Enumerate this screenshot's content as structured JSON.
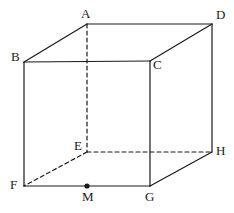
{
  "figure": {
    "name": "cube-abcd-efgh",
    "background_color": "#ffffff",
    "line_color": "#1a1a1a",
    "solid_stroke_width": 1.2,
    "dashed_stroke_width": 1.2,
    "dash_pattern": "4 3",
    "point_radius": 2.6
  },
  "vertices": [
    {
      "id": "A",
      "label": "A",
      "x": 87,
      "y": 24,
      "label_x": 81,
      "label_y": 7,
      "hidden": false
    },
    {
      "id": "B",
      "label": "B",
      "x": 24,
      "y": 62,
      "label_x": 11,
      "label_y": 50,
      "hidden": false
    },
    {
      "id": "C",
      "label": "C",
      "x": 150,
      "y": 61,
      "label_x": 153,
      "label_y": 58,
      "hidden": false
    },
    {
      "id": "D",
      "label": "D",
      "x": 212,
      "y": 24,
      "label_x": 216,
      "label_y": 8,
      "hidden": false
    },
    {
      "id": "E",
      "label": "E",
      "x": 87,
      "y": 152,
      "label_x": 74,
      "label_y": 139,
      "hidden": true
    },
    {
      "id": "F",
      "label": "F",
      "x": 24,
      "y": 186,
      "label_x": 10,
      "label_y": 178,
      "hidden": false
    },
    {
      "id": "G",
      "label": "G",
      "x": 150,
      "y": 186,
      "label_x": 145,
      "label_y": 190,
      "hidden": false
    },
    {
      "id": "H",
      "label": "H",
      "x": 212,
      "y": 152,
      "label_x": 216,
      "label_y": 144,
      "hidden": false
    }
  ],
  "points": [
    {
      "id": "M",
      "label": "M",
      "x": 87,
      "y": 186,
      "label_x": 82,
      "label_y": 190,
      "marked": true
    }
  ],
  "edges": [
    {
      "id": "AB",
      "from": "A",
      "to": "B",
      "style": "solid"
    },
    {
      "id": "AD",
      "from": "A",
      "to": "D",
      "style": "solid"
    },
    {
      "id": "BC",
      "from": "B",
      "to": "C",
      "style": "solid"
    },
    {
      "id": "CD",
      "from": "C",
      "to": "D",
      "style": "solid"
    },
    {
      "id": "BF",
      "from": "B",
      "to": "F",
      "style": "solid"
    },
    {
      "id": "CG",
      "from": "C",
      "to": "G",
      "style": "solid"
    },
    {
      "id": "DH",
      "from": "D",
      "to": "H",
      "style": "solid"
    },
    {
      "id": "FG",
      "from": "F",
      "to": "G",
      "style": "solid"
    },
    {
      "id": "GH",
      "from": "G",
      "to": "H",
      "style": "solid"
    },
    {
      "id": "AE",
      "from": "A",
      "to": "E",
      "style": "dashed"
    },
    {
      "id": "EF",
      "from": "E",
      "to": "F",
      "style": "dashed"
    },
    {
      "id": "EH",
      "from": "E",
      "to": "H",
      "style": "dashed"
    }
  ]
}
